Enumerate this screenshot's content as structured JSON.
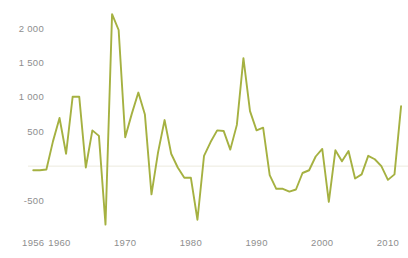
{
  "chart_data": {
    "type": "line",
    "title": "",
    "subtitle": "",
    "xlabel": "",
    "ylabel": "",
    "xlim": [
      1955.2,
      2012.6
    ],
    "ylim": [
      -900,
      2300
    ],
    "grid": "zero-line-only",
    "legend": "none",
    "line_color": "#a8b council",
    "series": [
      {
        "name": "Annual value",
        "color": "#a5b141",
        "x": [
          1956,
          1957,
          1958,
          1959,
          1960,
          1961,
          1962,
          1963,
          1964,
          1965,
          1966,
          1967,
          1968,
          1969,
          1970,
          1971,
          1972,
          1973,
          1974,
          1975,
          1976,
          1977,
          1978,
          1979,
          1980,
          1981,
          1982,
          1983,
          1984,
          1985,
          1986,
          1987,
          1988,
          1989,
          1990,
          1991,
          1992,
          1993,
          1994,
          1995,
          1996,
          1997,
          1998,
          1999,
          2000,
          2001,
          2002,
          2003,
          2004,
          2005,
          2006,
          2007,
          2008,
          2009,
          2010,
          2011,
          2012
        ],
        "values": [
          -60,
          -60,
          -50,
          360,
          700,
          180,
          1010,
          1010,
          -20,
          520,
          440,
          -850,
          2210,
          1980,
          420,
          760,
          1070,
          750,
          -410,
          200,
          670,
          180,
          -20,
          -170,
          -170,
          -780,
          150,
          350,
          520,
          510,
          240,
          600,
          1570,
          800,
          520,
          560,
          -130,
          -330,
          -330,
          -370,
          -340,
          -100,
          -60,
          140,
          250,
          -520,
          230,
          70,
          220,
          -180,
          -120,
          150,
          100,
          0,
          -200,
          -120,
          870
        ]
      }
    ],
    "y_ticks": [
      {
        "value": 2000,
        "label": "2 000"
      },
      {
        "value": 1500,
        "label": "1 500"
      },
      {
        "value": 1000,
        "label": "1 000"
      },
      {
        "value": 500,
        "label": "500"
      },
      {
        "value": -500,
        "label": "-500"
      }
    ],
    "x_ticks": [
      {
        "value": 1956,
        "label": "1956"
      },
      {
        "value": 1960,
        "label": "1960"
      },
      {
        "value": 1970,
        "label": "1970"
      },
      {
        "value": 1980,
        "label": "1980"
      },
      {
        "value": 1990,
        "label": "1990"
      },
      {
        "value": 2000,
        "label": "2000"
      },
      {
        "value": 2010,
        "label": "2010"
      }
    ],
    "colors": {
      "line": "#a5b141",
      "axis_text": "#8e8e8e",
      "zero_line": "#eceade",
      "background": "#ffffff"
    }
  }
}
